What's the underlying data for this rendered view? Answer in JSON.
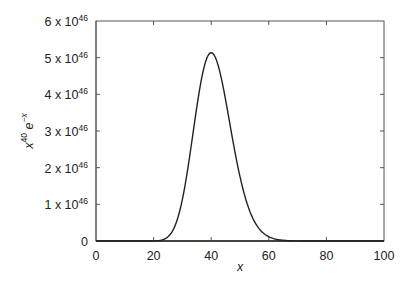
{
  "chart_data": {
    "type": "line",
    "title": "",
    "xlabel": "x",
    "ylabel": "x^40 e^-x",
    "xlim": [
      0,
      100
    ],
    "ylim": [
      0,
      6e+46
    ],
    "grid": false,
    "legend": null,
    "x_ticks": [
      0,
      20,
      40,
      60,
      80,
      100
    ],
    "x_tick_labels": [
      "0",
      "20",
      "40",
      "60",
      "80",
      "100"
    ],
    "y_ticks": [
      0,
      1e+46,
      2e+46,
      3e+46,
      4e+46,
      5e+46,
      6e+46
    ],
    "y_tick_labels": [
      {
        "mant": "0",
        "exp": ""
      },
      {
        "mant": "1 x 10",
        "exp": "46"
      },
      {
        "mant": "2 x 10",
        "exp": "46"
      },
      {
        "mant": "3 x 10",
        "exp": "46"
      },
      {
        "mant": "4 x 10",
        "exp": "46"
      },
      {
        "mant": "5 x 10",
        "exp": "46"
      },
      {
        "mant": "6 x 10",
        "exp": "46"
      }
    ],
    "series": [
      {
        "name": "x^40 e^-x",
        "function": "x^40 * exp(-x)",
        "peak": {
          "x": 40,
          "y": 5.16e+46
        },
        "x": [
          0,
          15,
          20,
          22,
          24,
          26,
          28,
          30,
          32,
          34,
          36,
          38,
          40,
          42,
          44,
          46,
          48,
          50,
          52,
          54,
          56,
          58,
          60,
          62,
          64,
          66,
          70,
          75,
          80,
          100
        ],
        "y_1e46": [
          0,
          5e-07,
          0.00227,
          0.0149,
          0.0623,
          0.186,
          0.434,
          1.14,
          1.63,
          2.78,
          3.95,
          4.86,
          5.16,
          4.9,
          4.24,
          3.38,
          2.51,
          1.77,
          1.16,
          0.724,
          0.426,
          0.239,
          0.117,
          0.0551,
          0.0249,
          0.0107,
          0.0025,
          0.0002,
          1e-05,
          0
        ]
      }
    ]
  },
  "axes": {
    "xlabel": "x",
    "ylabel_base": "x",
    "ylabel_exp1": "40",
    "ylabel_mid": " e",
    "ylabel_exp2": "−x"
  }
}
